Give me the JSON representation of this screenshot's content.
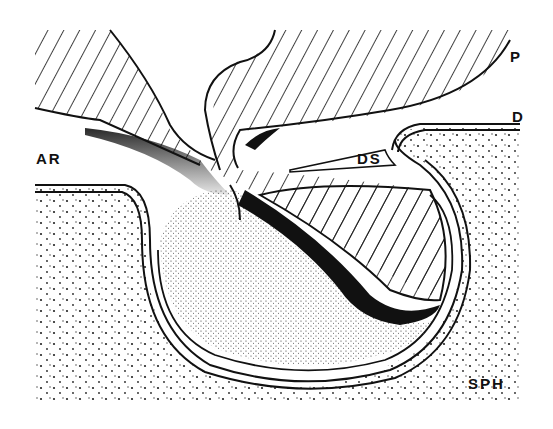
{
  "figure": {
    "type": "anatomical line drawing",
    "labels": {
      "P": "P",
      "D": "D",
      "DS": "DS",
      "AR": "AR",
      "SPH": "SPH"
    },
    "colors": {
      "ink": "#111111",
      "background": "#ffffff"
    }
  }
}
